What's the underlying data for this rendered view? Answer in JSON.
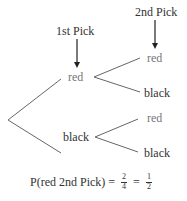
{
  "diagram": {
    "type": "tree",
    "headers": {
      "first_pick": "1st Pick",
      "second_pick": "2nd Pick"
    },
    "level1": [
      {
        "label": "red"
      },
      {
        "label": "black"
      }
    ],
    "level2": [
      {
        "parent": "red",
        "label": "red"
      },
      {
        "parent": "red",
        "label": "black"
      },
      {
        "parent": "black",
        "label": "red"
      },
      {
        "parent": "black",
        "label": "black"
      }
    ],
    "formula": {
      "lhs": "P(red 2nd Pick)",
      "eq1": "=",
      "frac1_num": "2",
      "frac1_den": "4",
      "eq2": "=",
      "frac2_num": "1",
      "frac2_den": "2"
    }
  }
}
